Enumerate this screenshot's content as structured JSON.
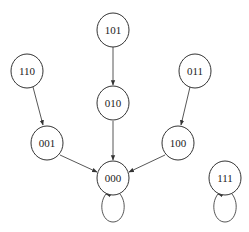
{
  "diagram": {
    "type": "state-transition-graph",
    "nodes": [
      {
        "id": "101",
        "label": "101",
        "cx": 113,
        "cy": 30
      },
      {
        "id": "110",
        "label": "110",
        "cx": 27,
        "cy": 71
      },
      {
        "id": "011",
        "label": "011",
        "cx": 195,
        "cy": 71
      },
      {
        "id": "010",
        "label": "010",
        "cx": 113,
        "cy": 103
      },
      {
        "id": "001",
        "label": "001",
        "cx": 47,
        "cy": 143
      },
      {
        "id": "100",
        "label": "100",
        "cx": 178,
        "cy": 143
      },
      {
        "id": "000",
        "label": "000",
        "cx": 113,
        "cy": 178
      },
      {
        "id": "111",
        "label": "111",
        "cx": 225,
        "cy": 178
      }
    ],
    "edges": [
      {
        "from": "101",
        "to": "010"
      },
      {
        "from": "110",
        "to": "001"
      },
      {
        "from": "011",
        "to": "100"
      },
      {
        "from": "010",
        "to": "000"
      },
      {
        "from": "001",
        "to": "000"
      },
      {
        "from": "100",
        "to": "000"
      },
      {
        "from": "000",
        "to": "000"
      },
      {
        "from": "111",
        "to": "111"
      }
    ],
    "colors": {
      "stroke": "#333333",
      "text": "#222222",
      "background": "#ffffff"
    }
  }
}
